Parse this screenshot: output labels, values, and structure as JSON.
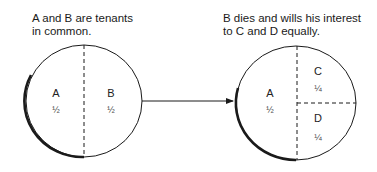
{
  "captions": {
    "left": "A and B are tenants\nin common.",
    "right": "B dies and wills his interest\nto C and D equally."
  },
  "left_circle": {
    "segments": [
      {
        "owner": "A",
        "share": "½"
      },
      {
        "owner": "B",
        "share": "½"
      }
    ]
  },
  "right_circle": {
    "segments": [
      {
        "owner": "A",
        "share": "½"
      },
      {
        "owner": "C",
        "share": "¼"
      },
      {
        "owner": "D",
        "share": "¼"
      }
    ]
  },
  "colors": {
    "stroke": "#1a1a1a",
    "background": "#ffffff"
  }
}
